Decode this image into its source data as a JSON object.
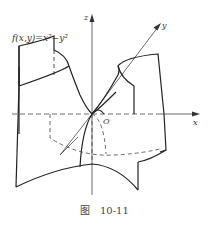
{
  "figure": {
    "function_label": "f(x,y)=x²−y²",
    "axis_labels": {
      "x": "x",
      "y": "y",
      "z": "z",
      "origin": "O"
    },
    "caption": {
      "prefix": "图",
      "number": "10-11"
    },
    "colors": {
      "stroke": "#222222",
      "dashed": "#444444",
      "background": "#ffffff"
    }
  }
}
